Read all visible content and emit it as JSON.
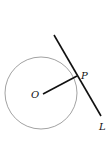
{
  "diagram": {
    "labels": {
      "center": "O",
      "point": "P",
      "line": "L"
    },
    "circle": {
      "cx": 41,
      "cy": 93,
      "r": 36,
      "stroke": "#8a8a8a"
    },
    "radius": {
      "x1": 43,
      "y1": 94,
      "x2": 77,
      "y2": 76,
      "stroke": "#111111"
    },
    "tangent": {
      "x1": 54,
      "y1": 35,
      "x2": 101,
      "y2": 116,
      "stroke": "#111111"
    },
    "label_positions": {
      "O": {
        "x": 31,
        "y": 98
      },
      "P": {
        "x": 81,
        "y": 79
      },
      "L": {
        "x": 99,
        "y": 130
      }
    }
  }
}
